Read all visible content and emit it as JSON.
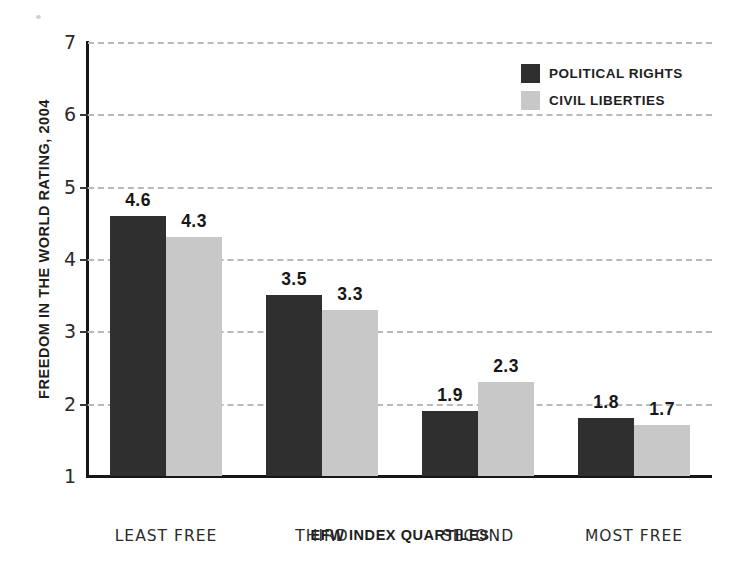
{
  "chart_data": {
    "type": "bar",
    "title": "",
    "xlabel": "EFW INDEX QUARTILES",
    "ylabel": "FREEDOM IN THE WORLD RATING, 2004",
    "categories": [
      "LEAST FREE",
      "THIRD",
      "SECOND",
      "MOST FREE"
    ],
    "series": [
      {
        "name": "POLITICAL RIGHTS",
        "color": "#2f2f2f",
        "values": [
          4.6,
          3.5,
          1.9,
          1.8
        ]
      },
      {
        "name": "CIVIL LIBERTIES",
        "color": "#c8c8c8",
        "values": [
          4.3,
          3.3,
          2.3,
          1.7
        ]
      }
    ],
    "ylim": [
      1,
      7
    ],
    "yticks": [
      1,
      2,
      3,
      4,
      5,
      6,
      7
    ],
    "ytick_labels": [
      "1",
      "2",
      "3",
      "4",
      "5",
      "6",
      "7"
    ],
    "grid": true,
    "grid_style": "dashed",
    "grid_color": "#b9b9b9",
    "legend_position": "top-right",
    "value_labels": [
      [
        "4.6",
        "4.3"
      ],
      [
        "3.5",
        "3.3"
      ],
      [
        "1.9",
        "2.3"
      ],
      [
        "1.8",
        "1.7"
      ]
    ]
  }
}
